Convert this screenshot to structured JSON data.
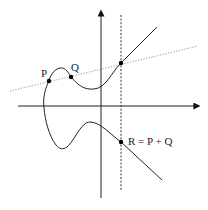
{
  "diagram": {
    "labels": {
      "p": "P",
      "q": "Q",
      "r": "R = P + Q"
    },
    "points": [
      {
        "id": "P",
        "role": "first operand"
      },
      {
        "id": "Q",
        "role": "second operand"
      },
      {
        "id": "-R",
        "role": "third intersection of secant with curve"
      },
      {
        "id": "R",
        "role": "sum, reflection across x-axis"
      }
    ],
    "lines": [
      {
        "id": "secant",
        "style": "dotted",
        "through": [
          "P",
          "Q",
          "-R"
        ]
      },
      {
        "id": "vertical",
        "style": "dashed",
        "through": [
          "-R",
          "R"
        ]
      }
    ],
    "colors": {
      "curve": "#222222",
      "axes": "#222222",
      "secant": "#999999",
      "vertical": "#333333",
      "point": "#000000"
    }
  }
}
